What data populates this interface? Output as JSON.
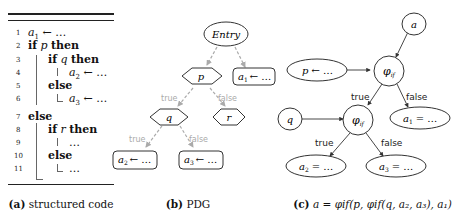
{
  "panel_a": {
    "caption_label": "(a)",
    "caption_text": "structured code",
    "lines": [
      {
        "num": "1",
        "parts": [
          {
            "t": "a",
            "style": "it"
          },
          {
            "t": "1",
            "style": "sub"
          },
          {
            "t": " ← …",
            "style": "plain"
          }
        ]
      },
      {
        "num": "2",
        "text": "if p then"
      },
      {
        "num": "3",
        "text": "if q then"
      },
      {
        "num": "4",
        "text": "a₂ ← …"
      },
      {
        "num": "5",
        "text": "else"
      },
      {
        "num": "6",
        "text": "a₃ ← …"
      },
      {
        "num": "7",
        "text": "else"
      },
      {
        "num": "8",
        "text": "if r then"
      },
      {
        "num": "9",
        "text": "…"
      },
      {
        "num": "10",
        "text": "else"
      },
      {
        "num": "11",
        "text": "…"
      }
    ],
    "kw": {
      "if": "if",
      "then": "then",
      "else": "else"
    },
    "vars": {
      "p": "p",
      "q": "q",
      "r": "r",
      "a1": "a",
      "a2": "a",
      "a3": "a",
      "sub1": "1",
      "sub2": "2",
      "sub3": "3",
      "assign": "← …",
      "ellipsis": "…"
    }
  },
  "panel_b": {
    "caption_label": "(b)",
    "caption_text": "PDG",
    "nodes": {
      "entry": "Entry",
      "p": "p",
      "q": "q",
      "r": "r",
      "a1_var": "a",
      "a1_sub": "1",
      "a1_rhs": "← …",
      "a2_var": "a",
      "a2_sub": "2",
      "a2_rhs": "← …",
      "a3_var": "a",
      "a3_sub": "3",
      "a3_rhs": "← …"
    },
    "edge_labels": {
      "p_true": "true",
      "p_false": "false",
      "q_true": "true",
      "q_false": "false"
    },
    "edge_color": "#aaaaaa"
  },
  "panel_c": {
    "caption_label": "(c)",
    "caption_formula": "a = φif(p, φif(q, a₂, a₃), a₁)",
    "nodes": {
      "a": "a",
      "p_var": "p",
      "p_rhs": "← …",
      "phi": "φ",
      "phi_sub": "if",
      "q": "q",
      "a1_var": "a",
      "a1_sub": "1",
      "a1_rhs": "= …",
      "a2_var": "a",
      "a2_sub": "2",
      "a2_rhs": "= …",
      "a3_var": "a",
      "a3_sub": "3",
      "a3_rhs": "= …"
    },
    "edge_labels": {
      "phi1_true": "true",
      "phi1_false": "false",
      "phi2_true": "true",
      "phi2_false": "false"
    }
  }
}
